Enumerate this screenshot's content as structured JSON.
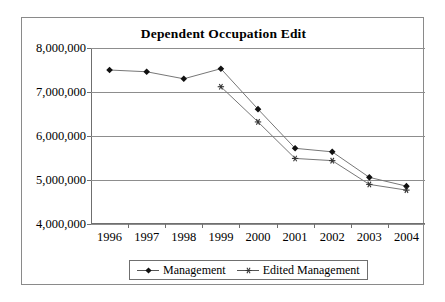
{
  "chart_data": {
    "type": "line",
    "title": "Dependent Occupation Edit",
    "xlabel": "",
    "ylabel": "",
    "categories": [
      "1996",
      "1997",
      "1998",
      "1999",
      "2000",
      "2001",
      "2002",
      "2003",
      "2004"
    ],
    "ylim": [
      4000000,
      8000000
    ],
    "ytick_labels": [
      "8,000,000",
      "7,000,000",
      "6,000,000",
      "5,000,000",
      "4,000,000"
    ],
    "yticks": [
      8000000,
      7000000,
      6000000,
      5000000,
      4000000
    ],
    "grid": true,
    "legend_position": "bottom",
    "series": [
      {
        "name": "Management",
        "marker": "diamond",
        "color": "#111111",
        "line_color": "#777777",
        "values": [
          7500000,
          7460000,
          7300000,
          7530000,
          6610000,
          5720000,
          5640000,
          5060000,
          4860000
        ]
      },
      {
        "name": "Edited Management",
        "marker": "star",
        "color": "#333333",
        "line_color": "#777777",
        "values": [
          null,
          null,
          null,
          7120000,
          6320000,
          5490000,
          5440000,
          4900000,
          4770000
        ]
      }
    ]
  },
  "legend": {
    "items": [
      {
        "label": "Management"
      },
      {
        "label": "Edited Management"
      }
    ]
  }
}
